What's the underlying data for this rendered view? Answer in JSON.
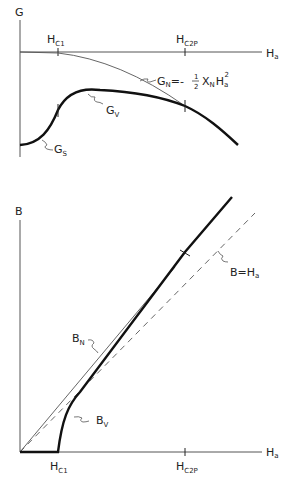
{
  "top_panel": {
    "y_axis_label": "G",
    "x_axis_label": {
      "main": "H",
      "sub": "a"
    },
    "ticks": [
      {
        "main": "H",
        "sub": "C1"
      },
      {
        "main": "H",
        "sub": "C2P"
      }
    ],
    "curves": {
      "normal": {
        "main": "G",
        "sub": "N",
        "formula_prefix": "=- ",
        "formula_num": "1",
        "formula_den": "2",
        "chi": "X",
        "chi_sub": "N",
        "h": "H",
        "h_sub": "a",
        "h_sup": "2"
      },
      "vortex": {
        "main": "G",
        "sub": "V"
      },
      "superconducting": {
        "main": "G",
        "sub": "S"
      }
    }
  },
  "bottom_panel": {
    "y_axis_label": "B",
    "x_axis_label": {
      "main": "H",
      "sub": "a"
    },
    "ticks": [
      {
        "main": "H",
        "sub": "C1"
      },
      {
        "main": "H",
        "sub": "C2P"
      }
    ],
    "curves": {
      "normal": {
        "main": "B",
        "sub": "N"
      },
      "vortex": {
        "main": "B",
        "sub": "V"
      },
      "reference": {
        "text": "B=H",
        "sub": "a"
      }
    }
  }
}
